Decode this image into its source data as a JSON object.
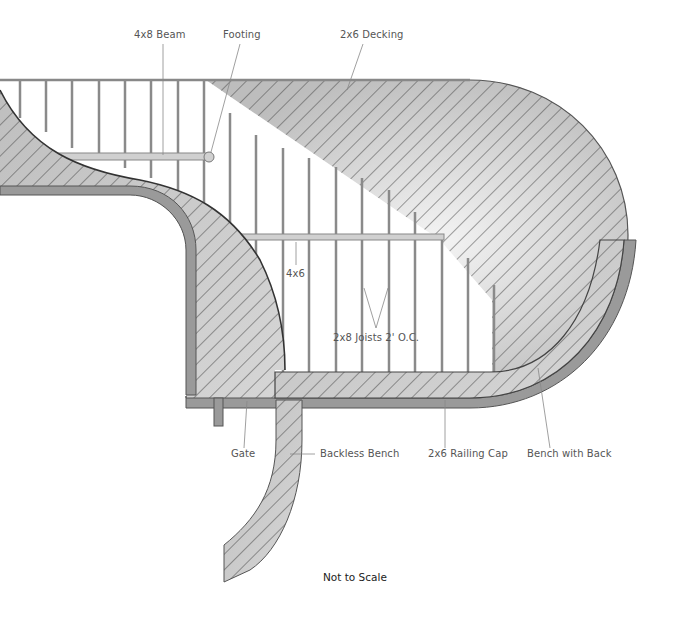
{
  "diagram": {
    "type": "deck-plan",
    "labels": {
      "beam": "4x8 Beam",
      "footing": "Footing",
      "decking": "2x6 Decking",
      "post": "4x6",
      "joists": "2x8 Joists 2' O.C.",
      "gate": "Gate",
      "backless_bench": "Backless Bench",
      "railing_cap": "2x6 Railing Cap",
      "bench_with_back": "Bench with Back"
    },
    "note": "Not to Scale",
    "colors": {
      "fill": "#c8c8c8",
      "rail": "#9a9a9a",
      "stroke": "#555555",
      "joist": "#8a8a8a",
      "hatch": "#444444"
    }
  }
}
